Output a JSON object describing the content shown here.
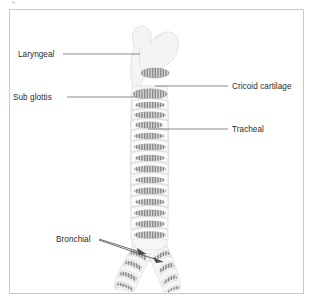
{
  "figure": {
    "background_color": "#ffffff",
    "frame_color": "#c9c9c9",
    "label_color": "#2b2b2b",
    "leader_color": "#4a4a4a",
    "cartilage_color": "#8f8f8f",
    "tissue_color": "#f4f4f4"
  },
  "labels": {
    "laryngeal": "Laryngeal",
    "sub_glottis": "Sub glottis",
    "cricoid_cartilage": "Cricoid cartilage",
    "tracheal": "Tracheal",
    "bronchial": "Bronchial"
  },
  "annotations": [
    {
      "id": "laryngeal",
      "text": "Laryngeal",
      "side": "left",
      "text_x": 18,
      "text_y": 57,
      "line_x1": 63,
      "line_x2": 140,
      "line_y": 54
    },
    {
      "id": "sub-glottis",
      "text": "Sub glottis",
      "side": "left",
      "text_x": 13,
      "text_y": 100,
      "line_x1": 67,
      "line_x2": 137,
      "line_y": 97
    },
    {
      "id": "cricoid-cartilage",
      "text": "Cricoid cartilage",
      "side": "right",
      "text_x": 232,
      "text_y": 89,
      "line_x1": 155,
      "line_x2": 228,
      "line_y": 86
    },
    {
      "id": "tracheal",
      "text": "Tracheal",
      "side": "right",
      "text_x": 232,
      "text_y": 132,
      "line_x1": 148,
      "line_x2": 228,
      "line_y": 129
    },
    {
      "id": "bronchial",
      "text": "Bronchial",
      "side": "left",
      "text_x": 56,
      "text_y": 242,
      "line_x1": 99,
      "line_x2": 160,
      "line_y": 239
    }
  ],
  "anatomy": {
    "larynx": {
      "name": "larynx-thyroid-cartilage",
      "center_x": 148,
      "top_y": 26,
      "bottom_y": 88
    },
    "trachea": {
      "name": "trachea",
      "top_y": 88,
      "bottom_y": 248,
      "ring_count": 17
    },
    "bronchi": {
      "name": "bronchi",
      "left_branch": "left-main-bronchus",
      "right_branch": "right-main-bronchus",
      "split_y": 248
    }
  }
}
